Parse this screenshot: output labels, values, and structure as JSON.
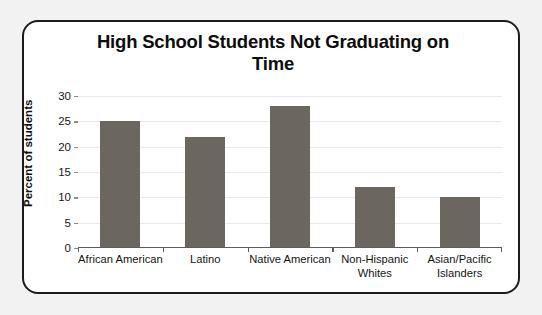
{
  "chart_data": {
    "type": "bar",
    "title": "High School Students Not Graduating on Time",
    "title_line1": "High School Students Not Graduating on",
    "title_line2": "Time",
    "xlabel": "",
    "ylabel": "Percent of students",
    "categories": [
      "African American",
      "Latino",
      "Native American",
      "Non-Hispanic Whites",
      "Asian/Pacific Islanders"
    ],
    "category_lines": [
      [
        "African American"
      ],
      [
        "Latino"
      ],
      [
        "Native American"
      ],
      [
        "Non-Hispanic",
        "Whites"
      ],
      [
        "Asian/Pacific",
        "Islanders"
      ]
    ],
    "values": [
      25,
      22,
      28,
      12,
      10
    ],
    "ylim": [
      0,
      30
    ],
    "yticks": [
      0,
      5,
      10,
      15,
      20,
      25,
      30
    ],
    "ytick_labels": [
      "0",
      "5",
      "10",
      "15",
      "20",
      "25",
      "30"
    ],
    "grid": true,
    "legend": "none",
    "bar_color": "#6b6660",
    "gridline_color": "#e7e9ef",
    "axis_color": "#5d5d5d",
    "frame_color": "#1b1b1b",
    "plot_background": "#ffffff",
    "page_background": "#f2f2f2"
  }
}
